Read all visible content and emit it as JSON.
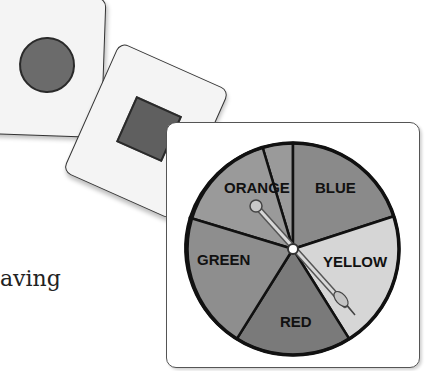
{
  "cards": [
    {
      "shape": "circle",
      "shape_color": "#6b6b6b"
    },
    {
      "shape": "square",
      "shape_color": "#5f5f5f"
    }
  ],
  "body_text": "aving",
  "spinner": {
    "segments": [
      {
        "label": "ORANGE",
        "color": "#9a9a9a"
      },
      {
        "label": "BLUE",
        "color": "#8a8a8a"
      },
      {
        "label": "YELLOW",
        "color": "#d6d6d6"
      },
      {
        "label": "RED",
        "color": "#7a7a7a"
      },
      {
        "label": "GREEN",
        "color": "#8e8e8e"
      }
    ],
    "arrow_pointing_to": "YELLOW"
  }
}
